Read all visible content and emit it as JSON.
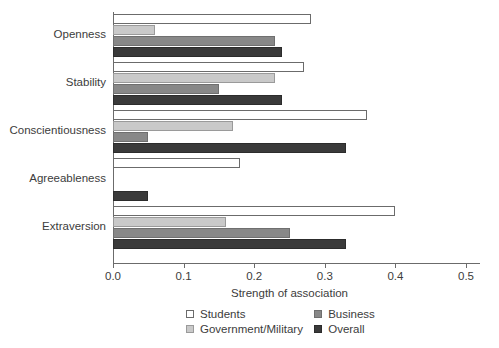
{
  "chart_data": {
    "type": "bar",
    "orientation": "horizontal",
    "title": "",
    "xlabel": "Strength of association",
    "ylabel": "",
    "xlim": [
      0.0,
      0.5
    ],
    "xticks": [
      "0.0",
      "0.1",
      "0.2",
      "0.3",
      "0.4",
      "0.5"
    ],
    "xtick_values": [
      0.0,
      0.1,
      0.2,
      0.3,
      0.4,
      0.5
    ],
    "grid": false,
    "legend_position": "bottom",
    "categories": [
      "Extraversion",
      "Agreeableness",
      "Conscientiousness",
      "Stability",
      "Openness"
    ],
    "categories_top_to_bottom": [
      "Openness",
      "Stability",
      "Conscientiousness",
      "Agreeableness",
      "Extraversion"
    ],
    "series": [
      {
        "name": "Students",
        "color": "#ffffff",
        "values_top_to_bottom": [
          0.28,
          0.27,
          0.36,
          0.18,
          0.4
        ]
      },
      {
        "name": "Government/Military",
        "color": "#c9c9c9",
        "values_top_to_bottom": [
          0.06,
          0.23,
          0.17,
          0.0,
          0.16
        ]
      },
      {
        "name": "Business",
        "color": "#888888",
        "values_top_to_bottom": [
          0.23,
          0.15,
          0.05,
          0.0,
          0.25
        ]
      },
      {
        "name": "Overall",
        "color": "#3a3a3a",
        "values_top_to_bottom": [
          0.24,
          0.24,
          0.33,
          0.05,
          0.33
        ]
      }
    ]
  },
  "legend": {
    "items": [
      {
        "label": "Students",
        "swatch": "sw-students"
      },
      {
        "label": "Government/Military",
        "swatch": "sw-govmil"
      },
      {
        "label": "Business",
        "swatch": "sw-business"
      },
      {
        "label": "Overall",
        "swatch": "sw-overall"
      }
    ]
  }
}
